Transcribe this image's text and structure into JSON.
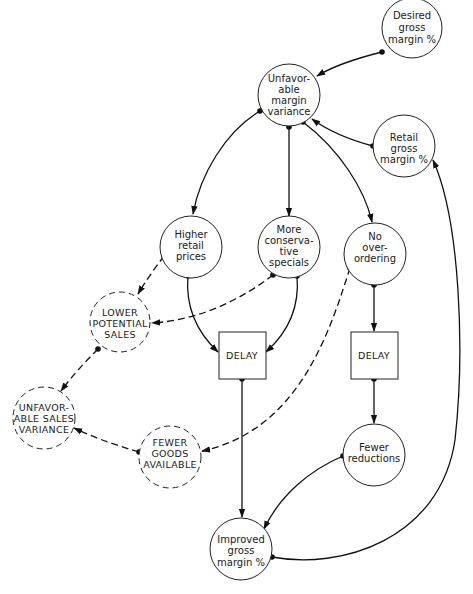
{
  "diagram": {
    "title": "",
    "nodes": [
      {
        "id": "desired",
        "shape": "circle",
        "style": "solid",
        "lines": [
          "Desired",
          "gross",
          "margin %"
        ]
      },
      {
        "id": "unfav_margin",
        "shape": "circle",
        "style": "solid",
        "lines": [
          "Unfavor-",
          "able",
          "margin",
          "variance"
        ]
      },
      {
        "id": "retail_gross",
        "shape": "circle",
        "style": "solid",
        "lines": [
          "Retail",
          "gross",
          "margin %"
        ]
      },
      {
        "id": "higher_prices",
        "shape": "circle",
        "style": "solid",
        "lines": [
          "Higher",
          "retail",
          "prices"
        ]
      },
      {
        "id": "conservative",
        "shape": "circle",
        "style": "solid",
        "lines": [
          "More",
          "conserva-",
          "tive",
          "specials"
        ]
      },
      {
        "id": "no_overordering",
        "shape": "circle",
        "style": "solid",
        "lines": [
          "No",
          "over-",
          "ordering"
        ]
      },
      {
        "id": "lower_sales",
        "shape": "circle",
        "style": "dashed",
        "lines": [
          "LOWER",
          "POTENTIAL",
          "SALES"
        ]
      },
      {
        "id": "delay_left",
        "shape": "box",
        "style": "solid",
        "lines": [
          "DELAY"
        ]
      },
      {
        "id": "delay_right",
        "shape": "box",
        "style": "solid",
        "lines": [
          "DELAY"
        ]
      },
      {
        "id": "unfav_sales",
        "shape": "circle",
        "style": "dashed",
        "lines": [
          "UNFAVOR-",
          "ABLE SALES",
          "VARIANCE"
        ]
      },
      {
        "id": "fewer_goods",
        "shape": "circle",
        "style": "dashed",
        "lines": [
          "FEWER",
          "GOODS",
          "AVAILABLE"
        ]
      },
      {
        "id": "fewer_reductions",
        "shape": "circle",
        "style": "solid",
        "lines": [
          "Fewer",
          "reductions"
        ]
      },
      {
        "id": "improved",
        "shape": "circle",
        "style": "solid",
        "lines": [
          "Improved",
          "gross",
          "margin %"
        ]
      }
    ],
    "edges": [
      {
        "from": "desired",
        "to": "unfav_margin",
        "style": "solid"
      },
      {
        "from": "retail_gross",
        "to": "unfav_margin",
        "style": "solid"
      },
      {
        "from": "unfav_margin",
        "to": "higher_prices",
        "style": "solid"
      },
      {
        "from": "unfav_margin",
        "to": "conservative",
        "style": "solid"
      },
      {
        "from": "unfav_margin",
        "to": "no_overordering",
        "style": "solid"
      },
      {
        "from": "higher_prices",
        "to": "delay_left",
        "style": "solid"
      },
      {
        "from": "conservative",
        "to": "delay_left",
        "style": "solid"
      },
      {
        "from": "higher_prices",
        "to": "lower_sales",
        "style": "dashed"
      },
      {
        "from": "conservative",
        "to": "lower_sales",
        "style": "dashed"
      },
      {
        "from": "lower_sales",
        "to": "unfav_sales",
        "style": "dashed"
      },
      {
        "from": "fewer_goods",
        "to": "unfav_sales",
        "style": "dashed"
      },
      {
        "from": "no_overordering",
        "to": "fewer_goods",
        "style": "dashed"
      },
      {
        "from": "no_overordering",
        "to": "delay_right",
        "style": "solid"
      },
      {
        "from": "delay_right",
        "to": "fewer_reductions",
        "style": "solid"
      },
      {
        "from": "delay_left",
        "to": "improved",
        "style": "solid"
      },
      {
        "from": "fewer_reductions",
        "to": "improved",
        "style": "solid"
      },
      {
        "from": "improved",
        "to": "retail_gross",
        "style": "solid"
      }
    ]
  },
  "labels": {
    "desired": {
      "l0": "Desired",
      "l1": "gross",
      "l2": "margin %"
    },
    "unfav_margin": {
      "l0": "Unfavor-",
      "l1": "able",
      "l2": "margin",
      "l3": "variance"
    },
    "retail_gross": {
      "l0": "Retail",
      "l1": "gross",
      "l2": "margin %"
    },
    "higher_prices": {
      "l0": "Higher",
      "l1": "retail",
      "l2": "prices"
    },
    "conservative": {
      "l0": "More",
      "l1": "conserva-",
      "l2": "tive",
      "l3": "specials"
    },
    "no_overordering": {
      "l0": "No",
      "l1": "over-",
      "l2": "ordering"
    },
    "lower_sales": {
      "l0": "LOWER",
      "l1": "POTENTIAL",
      "l2": "SALES"
    },
    "delay_left": {
      "l0": "DELAY"
    },
    "delay_right": {
      "l0": "DELAY"
    },
    "unfav_sales": {
      "l0": "UNFAVOR-",
      "l1": "ABLE SALES",
      "l2": "VARIANCE"
    },
    "fewer_goods": {
      "l0": "FEWER",
      "l1": "GOODS",
      "l2": "AVAILABLE"
    },
    "fewer_reductions": {
      "l0": "Fewer",
      "l1": "reductions"
    },
    "improved": {
      "l0": "Improved",
      "l1": "gross",
      "l2": "margin %"
    }
  }
}
